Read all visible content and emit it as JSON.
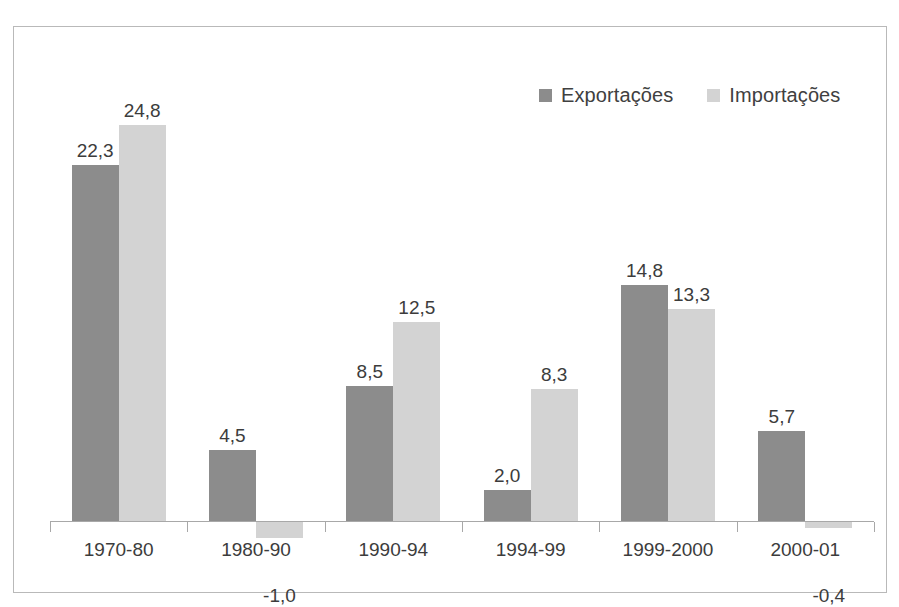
{
  "chart_data": {
    "type": "bar",
    "title": "",
    "subtitle": "",
    "xlabel": "",
    "ylabel": "",
    "grid": false,
    "legend_position": "top-right",
    "decimal_separator": ",",
    "ylim": [
      -2,
      26
    ],
    "categories": [
      "1970-80",
      "1980-90",
      "1990-94",
      "1994-99",
      "1999-2000",
      "2000-01"
    ],
    "series": [
      {
        "name": "Exportações",
        "color": "#8c8c8c",
        "values": [
          22.3,
          4.5,
          8.5,
          2.0,
          14.8,
          5.7
        ],
        "labels": [
          "22,3",
          "4,5",
          "8,5",
          "2,0",
          "14,8",
          "5,7"
        ]
      },
      {
        "name": "Importações",
        "color": "#d3d3d3",
        "values": [
          24.8,
          -1.0,
          12.5,
          8.3,
          13.3,
          -0.4
        ],
        "labels": [
          "24,8",
          "-1,0",
          "12,5",
          "8,3",
          "13,3",
          "-0,4"
        ]
      }
    ]
  },
  "legend": {
    "entries": [
      {
        "label": "Exportações",
        "color": "#8c8c8c",
        "swatch_name": "legend-swatch-exportacoes"
      },
      {
        "label": "Importações",
        "color": "#d3d3d3",
        "swatch_name": "legend-swatch-importacoes"
      }
    ]
  },
  "axis": {
    "baseline_color": "#a8a8a8"
  },
  "frame": {
    "border_color": "#b9b9b9"
  }
}
